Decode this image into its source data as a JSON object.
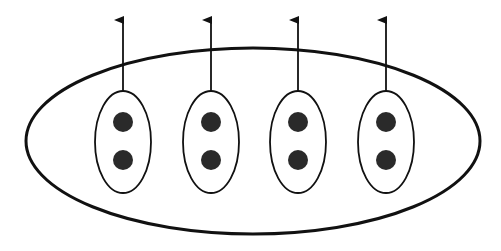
{
  "diagram": {
    "colors": {
      "stroke": "#111111",
      "dot": "#2a2a2a",
      "background": "#ffffff"
    },
    "outer": {
      "cx": 253,
      "cy": 141,
      "rx": 227,
      "ry": 93
    },
    "groups": [
      {
        "cx": 123,
        "cy": 142,
        "dots": 2,
        "arrow": "up"
      },
      {
        "cx": 211,
        "cy": 142,
        "dots": 2,
        "arrow": "up"
      },
      {
        "cx": 298,
        "cy": 142,
        "dots": 2,
        "arrow": "up"
      },
      {
        "cx": 386,
        "cy": 142,
        "dots": 2,
        "arrow": "up"
      }
    ]
  }
}
